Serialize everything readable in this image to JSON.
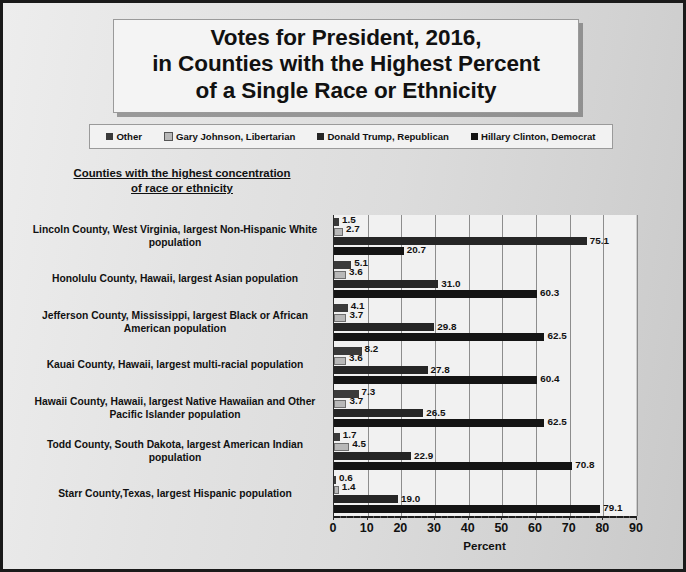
{
  "title": {
    "line1": "Votes for President, 2016,",
    "line2": "in Counties with the Highest Percent",
    "line3": "of a Single Race or Ethnicity"
  },
  "subtitle": {
    "line1": "Counties with the highest concentration",
    "line2": "of race or ethnicity"
  },
  "legend": [
    {
      "label": "Other",
      "color": "#3a3a3a"
    },
    {
      "label": "Gary Johnson, Libertarian",
      "color": "#b8b8b8"
    },
    {
      "label": "Donald Trump, Republican",
      "color": "#262626"
    },
    {
      "label": "Hillary Clinton, Democrat",
      "color": "#141414"
    }
  ],
  "chart_data": {
    "type": "bar",
    "orientation": "horizontal",
    "title": "Votes for President, 2016, in Counties with the Highest Percent of a Single Race or Ethnicity",
    "subtitle": "Counties with the highest concentration of race or ethnicity",
    "xlabel": "Percent",
    "ylabel": "",
    "xlim": [
      0,
      90
    ],
    "xticks": [
      0,
      10,
      20,
      30,
      40,
      50,
      60,
      70,
      80,
      90
    ],
    "grid": "vertical",
    "legend_position": "top",
    "categories": [
      "Lincoln County, West Virginia, largest Non-Hispanic White population",
      "Honolulu County, Hawaii, largest Asian population",
      "Jefferson County, Mississippi, largest Black or African American population",
      "Kauai County, Hawaii, largest multi-racial population",
      "Hawaii County, Hawaii, largest Native Hawaiian and Other Pacific Islander population",
      "Todd County, South Dakota, largest American Indian population",
      "Starr County,Texas, largest Hispanic population"
    ],
    "series": [
      {
        "name": "Other",
        "color": "#3a3a3a",
        "values": [
          1.5,
          5.1,
          4.1,
          8.2,
          7.3,
          1.7,
          0.6
        ]
      },
      {
        "name": "Gary Johnson, Libertarian",
        "color": "#b8b8b8",
        "values": [
          2.7,
          3.6,
          3.7,
          3.6,
          3.7,
          4.5,
          1.4
        ]
      },
      {
        "name": "Donald Trump, Republican",
        "color": "#262626",
        "values": [
          75.1,
          31.0,
          29.8,
          27.8,
          26.5,
          22.9,
          19.0
        ]
      },
      {
        "name": "Hillary Clinton, Democrat",
        "color": "#141414",
        "values": [
          20.7,
          60.3,
          62.5,
          60.4,
          62.5,
          70.8,
          79.1
        ]
      }
    ]
  }
}
